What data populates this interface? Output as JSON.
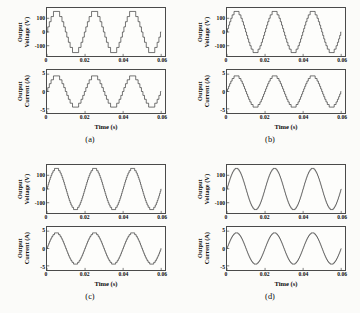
{
  "figure": {
    "panels": [
      {
        "caption": "(a)",
        "levels": 9,
        "voltage": {
          "ylabel_line1": "Output",
          "ylabel_line2": "Voltage (V)",
          "yticks": [
            100,
            0,
            -100
          ],
          "ylim": [
            -175,
            175
          ],
          "amplitude": 150
        },
        "current": {
          "ylabel_line1": "Output",
          "ylabel_line2": "Current (A)",
          "yticks": [
            5,
            0,
            -5
          ],
          "ylim": [
            -6.2,
            6.2
          ],
          "amplitude": 4.5
        },
        "xlabel": "Time (s)",
        "xticks": [
          0,
          0.02,
          0.04,
          0.06
        ],
        "xticklabels": [
          "0",
          "0.02",
          "0.04",
          "0.06"
        ],
        "xlim": [
          0,
          0.062
        ]
      },
      {
        "caption": "(b)",
        "levels": 13,
        "voltage": {
          "ylabel_line1": "Output",
          "ylabel_line2": "Voltage (V)",
          "yticks": [
            100,
            0,
            -100
          ],
          "ylim": [
            -175,
            175
          ],
          "amplitude": 150
        },
        "current": {
          "ylabel_line1": "Output",
          "ylabel_line2": "Current (A)",
          "yticks": [
            5,
            0,
            -5
          ],
          "ylim": [
            -6.2,
            6.2
          ],
          "amplitude": 4.5
        },
        "xlabel": "Time (s)",
        "xticks": [
          0,
          0.02,
          0.04,
          0.06
        ],
        "xticklabels": [
          "0",
          "0.02",
          "0.04",
          "0.06"
        ],
        "xlim": [
          0,
          0.062
        ]
      },
      {
        "caption": "(c)",
        "levels": 19,
        "voltage": {
          "ylabel_line1": "Output",
          "ylabel_line2": "Voltage (V)",
          "yticks": [
            100,
            0,
            -100
          ],
          "ylim": [
            -175,
            175
          ],
          "amplitude": 150
        },
        "current": {
          "ylabel_line1": "Output",
          "ylabel_line2": "Current (A)",
          "yticks": [
            5,
            0,
            -5
          ],
          "ylim": [
            -6.2,
            6.2
          ],
          "amplitude": 4.5
        },
        "xlabel": "Time (s)",
        "xticks": [
          0,
          0.02,
          0.04,
          0.06
        ],
        "xticklabels": [
          "0",
          "0.02",
          "0.04",
          "0.06"
        ],
        "xlim": [
          0,
          0.062
        ]
      },
      {
        "caption": "(d)",
        "levels": 31,
        "voltage": {
          "ylabel_line1": "Output",
          "ylabel_line2": "Voltage (V)",
          "yticks": [
            100,
            0,
            -100
          ],
          "ylim": [
            -175,
            175
          ],
          "amplitude": 150
        },
        "current": {
          "ylabel_line1": "Output",
          "ylabel_line2": "Current (A)",
          "yticks": [
            5,
            0,
            -5
          ],
          "ylim": [
            -6.2,
            6.2
          ],
          "amplitude": 4.5
        },
        "xlabel": "Time (s)",
        "xticks": [
          0,
          0.02,
          0.04,
          0.06
        ],
        "xticklabels": [
          "0",
          "0.02",
          "0.04",
          "0.06"
        ],
        "xlim": [
          0,
          0.062
        ]
      }
    ]
  },
  "chart_data": {
    "type": "line",
    "title": "",
    "frequency_hz": 50,
    "cycles_shown": 3,
    "xlabel": "Time (s)",
    "xlim": [
      0,
      0.062
    ],
    "xticks": [
      0,
      0.02,
      0.04,
      0.06
    ],
    "grid": false,
    "legend": "none",
    "subplots": [
      {
        "panel": "(a)",
        "levels": 9,
        "series": [
          {
            "name": "Output Voltage (V)",
            "waveform": "staircase",
            "amplitude": 150,
            "ylim": [
              -175,
              175
            ],
            "yticks": [
              100,
              0,
              -100
            ],
            "ylabel": "Output Voltage (V)"
          },
          {
            "name": "Output Current (A)",
            "waveform": "staircase",
            "amplitude": 4.5,
            "ylim": [
              -6.2,
              6.2
            ],
            "yticks": [
              5,
              0,
              -5
            ],
            "ylabel": "Output Current (A)"
          }
        ]
      },
      {
        "panel": "(b)",
        "levels": 13,
        "series": [
          {
            "name": "Output Voltage (V)",
            "waveform": "staircase",
            "amplitude": 150,
            "ylim": [
              -175,
              175
            ],
            "yticks": [
              100,
              0,
              -100
            ],
            "ylabel": "Output Voltage (V)"
          },
          {
            "name": "Output Current (A)",
            "waveform": "staircase",
            "amplitude": 4.5,
            "ylim": [
              -6.2,
              6.2
            ],
            "yticks": [
              5,
              0,
              -5
            ],
            "ylabel": "Output Current (A)"
          }
        ]
      },
      {
        "panel": "(c)",
        "levels": 19,
        "series": [
          {
            "name": "Output Voltage (V)",
            "waveform": "staircase",
            "amplitude": 150,
            "ylim": [
              -175,
              175
            ],
            "yticks": [
              100,
              0,
              -100
            ],
            "ylabel": "Output Voltage (V)"
          },
          {
            "name": "Output Current (A)",
            "waveform": "staircase",
            "amplitude": 4.5,
            "ylim": [
              -6.2,
              6.2
            ],
            "yticks": [
              5,
              0,
              -5
            ],
            "ylabel": "Output Current (A)"
          }
        ]
      },
      {
        "panel": "(d)",
        "levels": 31,
        "series": [
          {
            "name": "Output Voltage (V)",
            "waveform": "staircase",
            "amplitude": 150,
            "ylim": [
              -175,
              175
            ],
            "yticks": [
              100,
              0,
              -100
            ],
            "ylabel": "Output Voltage (V)"
          },
          {
            "name": "Output Current (A)",
            "waveform": "staircase",
            "amplitude": 4.5,
            "ylim": [
              -6.2,
              6.2
            ],
            "yticks": [
              5,
              0,
              -5
            ],
            "ylabel": "Output Current (A)"
          }
        ]
      }
    ]
  }
}
